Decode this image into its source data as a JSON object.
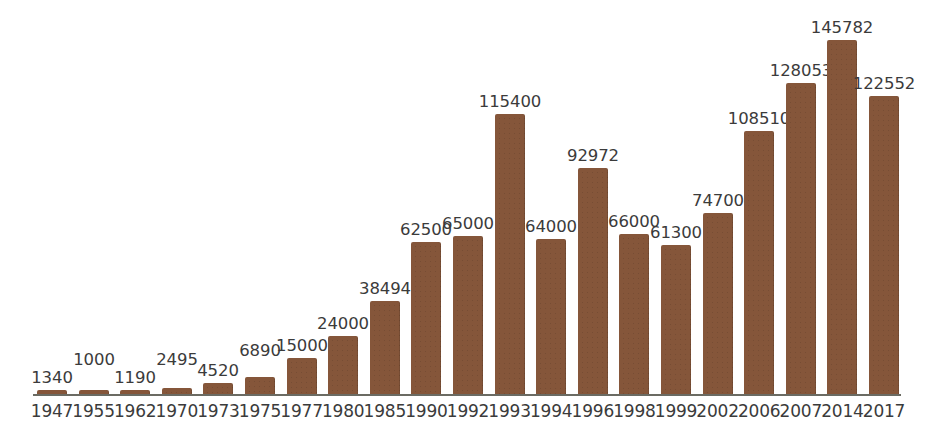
{
  "chart_data": {
    "type": "bar",
    "title": "",
    "subtitle": "",
    "xlabel": "",
    "ylabel": "",
    "grid": false,
    "legend": null,
    "axis_range": [
      0,
      145782
    ],
    "bar_color": "#85563a",
    "label_color": "#3b3b3b",
    "axis_color": "#6b6b63",
    "background_color": "#ffffff",
    "categories": [
      "1947",
      "1955",
      "1962",
      "1970",
      "1973",
      "1975",
      "1977",
      "1980",
      "1985",
      "1990",
      "1992",
      "1993",
      "1994",
      "1996",
      "1998",
      "1999",
      "2002",
      "2006",
      "2007",
      "2014",
      "2017"
    ],
    "values": [
      1340,
      1000,
      1190,
      2495,
      4520,
      6890,
      15000,
      24000,
      38494,
      62500,
      65000,
      115400,
      64000,
      92972,
      66000,
      61300,
      74700,
      108510,
      128053,
      145782,
      122552
    ],
    "value_labels": [
      "1340",
      "1000",
      "1190",
      "2495",
      "4520",
      "6890",
      "15000",
      "24000",
      "38494",
      "62500",
      "65000",
      "115400",
      "64000",
      "92972",
      "66000",
      "61300",
      "74700",
      "108510",
      "128053",
      "145782",
      "122552"
    ]
  }
}
